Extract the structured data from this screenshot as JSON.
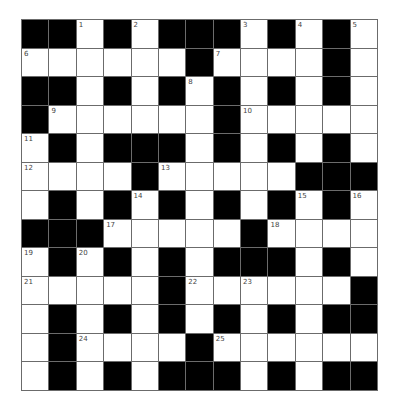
{
  "puzzle": {
    "rows": 13,
    "cols": 13,
    "layout": [
      "##.#.###.#.#.",
      "......#....#.",
      "##.#.#.#.#.#.",
      "#......#.....",
      ".#.###.#.#.#.",
      "....#.....###",
      ".#.#.#.#.#.#.",
      "###.....#....",
      ".#.#.#.###.#.",
      ".....#......#",
      ".#.#.#.#.#.##",
      ".#....#......",
      ".#.#.###.#.##"
    ],
    "numbers": [
      {
        "row": 0,
        "col": 2,
        "n": "1"
      },
      {
        "row": 0,
        "col": 4,
        "n": "2"
      },
      {
        "row": 0,
        "col": 8,
        "n": "3"
      },
      {
        "row": 0,
        "col": 10,
        "n": "4"
      },
      {
        "row": 0,
        "col": 12,
        "n": "5"
      },
      {
        "row": 1,
        "col": 0,
        "n": "6"
      },
      {
        "row": 1,
        "col": 7,
        "n": "7"
      },
      {
        "row": 2,
        "col": 6,
        "n": "8"
      },
      {
        "row": 3,
        "col": 1,
        "n": "9"
      },
      {
        "row": 3,
        "col": 8,
        "n": "10"
      },
      {
        "row": 4,
        "col": 0,
        "n": "11"
      },
      {
        "row": 5,
        "col": 0,
        "n": "12"
      },
      {
        "row": 5,
        "col": 5,
        "n": "13"
      },
      {
        "row": 6,
        "col": 4,
        "n": "14"
      },
      {
        "row": 6,
        "col": 10,
        "n": "15"
      },
      {
        "row": 6,
        "col": 12,
        "n": "16"
      },
      {
        "row": 7,
        "col": 3,
        "n": "17"
      },
      {
        "row": 7,
        "col": 9,
        "n": "18"
      },
      {
        "row": 8,
        "col": 0,
        "n": "19"
      },
      {
        "row": 8,
        "col": 2,
        "n": "20"
      },
      {
        "row": 9,
        "col": 0,
        "n": "21"
      },
      {
        "row": 9,
        "col": 6,
        "n": "22"
      },
      {
        "row": 9,
        "col": 8,
        "n": "23"
      },
      {
        "row": 11,
        "col": 2,
        "n": "24"
      },
      {
        "row": 11,
        "col": 7,
        "n": "25"
      }
    ],
    "colors": {
      "block": "#000000",
      "open": "#ffffff",
      "gridline": "#6b6b6b",
      "number": "#444444"
    }
  }
}
